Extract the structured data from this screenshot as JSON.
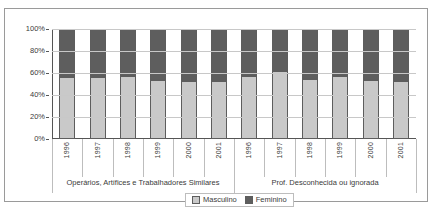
{
  "chart_data": {
    "type": "bar",
    "title": "",
    "subtitle": "",
    "xlabel": "",
    "ylabel": "",
    "stacked": true,
    "stacked_percent": true,
    "grid": true,
    "legend_position": "bottom",
    "ylim": [
      0,
      100
    ],
    "ytick_labels": [
      "0%",
      "20%",
      "40%",
      "60%",
      "80%",
      "100%"
    ],
    "ytick_values": [
      0,
      20,
      40,
      60,
      80,
      100
    ],
    "groups": [
      {
        "label": "Operários, Artífices e Trabalhadores Similares",
        "categories": [
          "1996",
          "1997",
          "1998",
          "1999",
          "2000",
          "2001"
        ]
      },
      {
        "label": "Prof. Desconhecida ou ignorada",
        "categories": [
          "1996",
          "1997",
          "1998",
          "1999",
          "2000",
          "2001"
        ]
      }
    ],
    "categories": [
      "1996",
      "1997",
      "1998",
      "1999",
      "2000",
      "2001",
      "1996",
      "1997",
      "1998",
      "1999",
      "2000",
      "2001"
    ],
    "series": [
      {
        "name": "Masculino",
        "color": "#c9c9c9",
        "values": [
          56,
          56,
          57,
          54,
          53,
          53,
          57,
          62,
          55,
          57,
          54,
          53
        ]
      },
      {
        "name": "Feminino",
        "color": "#5e5e5e",
        "values": [
          44,
          44,
          43,
          46,
          47,
          47,
          43,
          38,
          45,
          43,
          46,
          47
        ]
      }
    ],
    "legend": [
      {
        "label": "Masculino",
        "color": "#c9c9c9"
      },
      {
        "label": "Feminino",
        "color": "#5e5e5e"
      }
    ]
  }
}
